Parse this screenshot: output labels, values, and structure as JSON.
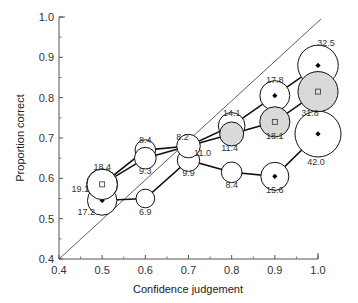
{
  "chart_data": {
    "type": "scatter",
    "title": "",
    "xlabel": "Confidence judgement",
    "ylabel": "Proportion correct",
    "xlim": [
      0.4,
      1.0
    ],
    "ylim": [
      0.4,
      1.0
    ],
    "xticks": [
      "0.4",
      "0.5",
      "0.6",
      "0.7",
      "0.8",
      "0.9",
      "1.0"
    ],
    "yticks": [
      "0.4",
      "0.5",
      "0.6",
      "0.7",
      "0.8",
      "0.9",
      "1.0"
    ],
    "grid": false,
    "reference_line": {
      "from": [
        0.4,
        0.4
      ],
      "to": [
        1.0,
        1.0
      ],
      "label": "perfect calibration"
    },
    "note": "Circle area proportional to labelled percentage of judgements; lines connect points of the same group.",
    "series": [
      {
        "name": "group-1 (white circles, diamond marker at 0.5/0.9/1.0)",
        "x": [
          0.5,
          0.6,
          0.7,
          0.8,
          0.9,
          1.0
        ],
        "y": [
          0.545,
          0.55,
          0.645,
          0.615,
          0.605,
          0.71
        ],
        "sizes": [
          17.2,
          6.9,
          9.9,
          8.4,
          15.6,
          42.0
        ],
        "size_labels": [
          "17.2",
          "6.9",
          "9.9",
          "8.4",
          "15.6",
          "42.0"
        ],
        "fill": [
          "#ffffff",
          "#ffffff",
          "#ffffff",
          "#ffffff",
          "#ffffff",
          "#ffffff"
        ],
        "marker": [
          "diamond",
          "none",
          "none",
          "none",
          "diamond",
          "diamond"
        ]
      },
      {
        "name": "group-2 (square marker, grey at 0.8-1.0)",
        "x": [
          0.5,
          0.6,
          0.7,
          0.8,
          0.9,
          1.0
        ],
        "y": [
          0.585,
          0.65,
          0.68,
          0.71,
          0.74,
          0.815
        ],
        "sizes": [
          18.4,
          9.3,
          11.0,
          11.4,
          18.1,
          31.8
        ],
        "size_labels": [
          "18.4",
          "9.3",
          "11.0",
          "11.4",
          "18.1",
          "31.8"
        ],
        "fill": [
          "#ffffff",
          "#ffffff",
          "#ffffff",
          "#d9d9d9",
          "#d9d9d9",
          "#d9d9d9"
        ],
        "marker": [
          "square",
          "none",
          "none",
          "none",
          "square",
          "square"
        ]
      },
      {
        "name": "group-3 (white circles)",
        "x": [
          0.5,
          0.6,
          0.7,
          0.8,
          0.9,
          1.0
        ],
        "y": [
          0.585,
          0.67,
          0.68,
          0.73,
          0.805,
          0.88
        ],
        "sizes": [
          19.1,
          8.4,
          8.2,
          14.1,
          17.8,
          32.5
        ],
        "size_labels": [
          "19.1",
          "8.4",
          "8.2",
          "14.1",
          "17.8",
          "32.5"
        ],
        "fill": [
          "#ffffff",
          "#ffffff",
          "#ffffff",
          "#ffffff",
          "#ffffff",
          "#ffffff"
        ],
        "marker": [
          "none",
          "none",
          "none",
          "none",
          "diamond",
          "diamond"
        ]
      }
    ],
    "colors": {
      "line": "#111111",
      "grey_fill": "#d9d9d9",
      "axis": "#555555"
    }
  }
}
